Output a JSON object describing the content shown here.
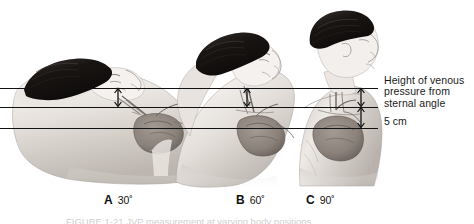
{
  "figure": {
    "background_color": "#ffffff",
    "line_color": "#111111",
    "text_color": "#1a1a1a",
    "skin_light": "#f2efec",
    "skin_mid": "#d9d4cf",
    "skin_shadow": "#b3aca6",
    "hair_color": "#1b1714",
    "organ_color": "#8d8580",
    "vessel_color": "#6e6762"
  },
  "annotations": {
    "venous_pressure_label_line1": "Height of venous",
    "venous_pressure_label_line2": "pressure from",
    "venous_pressure_label_line3": "sternal angle",
    "five_cm_label": "5 cm"
  },
  "panels": [
    {
      "letter": "A",
      "angle": "30˚",
      "position_description": "reclining at 30 degrees"
    },
    {
      "letter": "B",
      "angle": "60˚",
      "position_description": "semi-reclined at 60 degrees"
    },
    {
      "letter": "C",
      "angle": "90˚",
      "position_description": "upright at 90 degrees"
    }
  ],
  "reference_lines": [
    {
      "name": "venous-pressure-level-line",
      "y": 88
    },
    {
      "name": "sternal-angle-line",
      "y": 107
    },
    {
      "name": "right-atrium-line",
      "y": 128
    }
  ],
  "caption": {
    "text": "FIGURE 1-21   JVP measurement at varying body positions"
  }
}
